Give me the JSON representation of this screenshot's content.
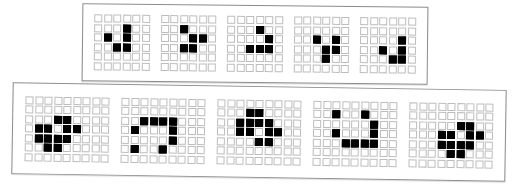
{
  "top_panel": {
    "label": "glider generations",
    "cols": 6,
    "rows": 6,
    "grids": [
      {
        "alive": [
          [
            1,
            3
          ],
          [
            2,
            1
          ],
          [
            2,
            3
          ],
          [
            3,
            2
          ],
          [
            3,
            3
          ]
        ]
      },
      {
        "alive": [
          [
            1,
            2
          ],
          [
            2,
            3
          ],
          [
            2,
            4
          ],
          [
            3,
            2
          ],
          [
            3,
            3
          ]
        ]
      },
      {
        "alive": [
          [
            1,
            3
          ],
          [
            2,
            4
          ],
          [
            3,
            2
          ],
          [
            3,
            3
          ],
          [
            3,
            4
          ]
        ]
      },
      {
        "alive": [
          [
            2,
            2
          ],
          [
            2,
            4
          ],
          [
            3,
            3
          ],
          [
            3,
            4
          ],
          [
            4,
            3
          ]
        ]
      },
      {
        "alive": [
          [
            2,
            4
          ],
          [
            3,
            2
          ],
          [
            3,
            4
          ],
          [
            4,
            3
          ],
          [
            4,
            4
          ]
        ]
      }
    ]
  },
  "bottom_panel": {
    "label": "spaceship generations",
    "cols": 9,
    "rows": 7,
    "grids": [
      {
        "alive": [
          [
            2,
            3
          ],
          [
            2,
            4
          ],
          [
            3,
            1
          ],
          [
            3,
            2
          ],
          [
            3,
            4
          ],
          [
            3,
            5
          ],
          [
            4,
            1
          ],
          [
            4,
            2
          ],
          [
            4,
            3
          ],
          [
            4,
            4
          ],
          [
            5,
            2
          ],
          [
            5,
            3
          ]
        ]
      },
      {
        "alive": [
          [
            2,
            2
          ],
          [
            2,
            3
          ],
          [
            2,
            4
          ],
          [
            2,
            5
          ],
          [
            3,
            1
          ],
          [
            3,
            5
          ],
          [
            4,
            5
          ],
          [
            5,
            1
          ],
          [
            5,
            4
          ]
        ]
      },
      {
        "alive": [
          [
            1,
            3
          ],
          [
            1,
            4
          ],
          [
            2,
            2
          ],
          [
            2,
            3
          ],
          [
            2,
            4
          ],
          [
            2,
            5
          ],
          [
            3,
            2
          ],
          [
            3,
            3
          ],
          [
            3,
            5
          ],
          [
            3,
            6
          ],
          [
            4,
            4
          ],
          [
            4,
            5
          ]
        ]
      },
      {
        "alive": [
          [
            1,
            2
          ],
          [
            1,
            5
          ],
          [
            2,
            6
          ],
          [
            3,
            2
          ],
          [
            3,
            6
          ],
          [
            4,
            3
          ],
          [
            4,
            4
          ],
          [
            4,
            5
          ],
          [
            4,
            6
          ]
        ]
      },
      {
        "alive": [
          [
            2,
            5
          ],
          [
            2,
            6
          ],
          [
            3,
            3
          ],
          [
            3,
            4
          ],
          [
            3,
            6
          ],
          [
            3,
            7
          ],
          [
            4,
            3
          ],
          [
            4,
            4
          ],
          [
            4,
            5
          ],
          [
            4,
            6
          ],
          [
            5,
            4
          ],
          [
            5,
            5
          ]
        ]
      }
    ]
  },
  "colors": {
    "alive": "#000000",
    "dead_border": "#bdbdbd",
    "panel_border": "#8c8c8c"
  }
}
